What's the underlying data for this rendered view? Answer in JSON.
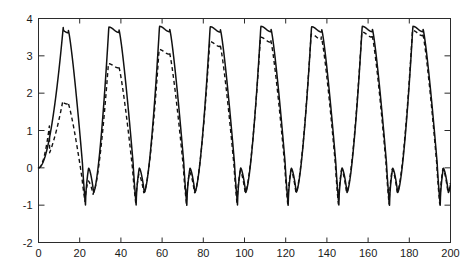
{
  "chart_data": {
    "type": "line",
    "title": "",
    "subtitle": "",
    "xlabel": "",
    "ylabel": "",
    "xlim": [
      0,
      200
    ],
    "ylim": [
      -2,
      4
    ],
    "grid": false,
    "legend": "none",
    "xticks": [
      0,
      20,
      40,
      60,
      80,
      100,
      120,
      140,
      160,
      180,
      200
    ],
    "xtick_labels": [
      "0",
      "20",
      "40",
      "60",
      "80",
      "100",
      "120",
      "140",
      "160",
      "180",
      "200"
    ],
    "yticks": [
      -2,
      -1,
      0,
      1,
      2,
      3,
      4
    ],
    "ytick_labels": [
      "-2",
      "-1",
      "0",
      "1",
      "2",
      "3",
      "4"
    ],
    "frame": "box",
    "tick_direction": "in",
    "annotations": [],
    "period": 24.6,
    "n_peaks": 8,
    "peak_value": 3.78,
    "trough_value": -1.02,
    "series": [
      {
        "name": "solid",
        "style": "solid",
        "color": "#111111",
        "peaks_x": [
          12.0,
          36.6,
          61.2,
          85.8,
          110.4,
          135.0,
          159.6,
          184.2
        ],
        "peaks_y": [
          3.76,
          3.77,
          3.79,
          3.78,
          3.79,
          3.78,
          3.79,
          3.79
        ],
        "troughs_x": [
          19.6,
          44.2,
          68.8,
          93.4,
          118.0,
          142.6,
          167.2,
          191.8
        ],
        "troughs_y": [
          -1.01,
          -1.01,
          -1.02,
          -1.01,
          -1.02,
          -1.01,
          -1.02,
          -1.02
        ],
        "start_value": 0.0,
        "end_value": 0.1
      },
      {
        "name": "dashed",
        "style": "dashed",
        "color": "#111111",
        "peaks_x": [
          11.8,
          36.2,
          60.9,
          85.6,
          110.2,
          134.8,
          159.4,
          184.0
        ],
        "peaks_y": [
          1.79,
          2.79,
          3.17,
          3.38,
          3.5,
          3.58,
          3.64,
          3.68
        ],
        "troughs_x": [
          20.0,
          44.6,
          69.1,
          93.7,
          118.3,
          142.9,
          167.5,
          192.1
        ],
        "troughs_y": [
          -0.92,
          -0.96,
          -0.98,
          -1.0,
          -1.0,
          -1.01,
          -1.01,
          -1.01
        ],
        "start_value": 0.0,
        "end_value": 0.08
      }
    ]
  },
  "axes": {
    "x_axis_name": "x-axis",
    "y_axis_name": "y-axis"
  }
}
